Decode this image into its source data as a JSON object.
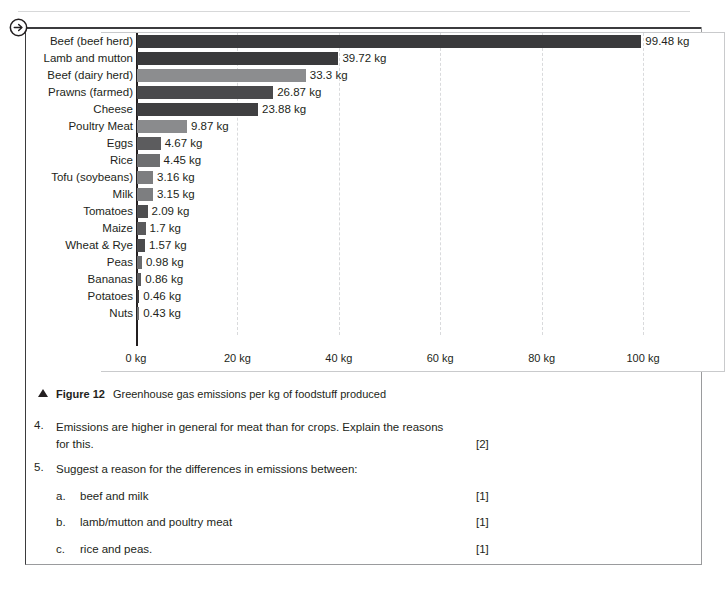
{
  "page": {
    "arrow_icon": "circled-arrow-right-icon"
  },
  "chart_data": {
    "type": "bar",
    "orientation": "horizontal",
    "title": "Greenhouse gas emissions per kg of foodstuff produced",
    "xlabel": "",
    "ylabel": "",
    "unit": "kg",
    "xlim": [
      0,
      100
    ],
    "grid": true,
    "gridlines": [
      20,
      40,
      60,
      80,
      100
    ],
    "legend": "none",
    "tick_labels": [
      "0 kg",
      "20 kg",
      "40 kg",
      "60 kg",
      "80 kg",
      "100 kg"
    ],
    "ticks": [
      0,
      20,
      40,
      60,
      80,
      100
    ],
    "categories": [
      "Beef (beef herd)",
      "Lamb and mutton",
      "Beef (dairy herd)",
      "Prawns (farmed)",
      "Cheese",
      "Poultry Meat",
      "Eggs",
      "Rice",
      "Tofu (soybeans)",
      "Milk",
      "Tomatoes",
      "Maize",
      "Wheat & Rye",
      "Peas",
      "Bananas",
      "Potatoes",
      "Nuts"
    ],
    "values": [
      99.48,
      39.72,
      33.3,
      26.87,
      23.88,
      9.87,
      4.67,
      4.45,
      3.16,
      3.15,
      2.09,
      1.7,
      1.57,
      0.98,
      0.86,
      0.46,
      0.43
    ],
    "value_labels": [
      "99.48 kg",
      "39.72 kg",
      "33.3 kg",
      "26.87 kg",
      "23.88 kg",
      "9.87 kg",
      "4.67 kg",
      "4.45 kg",
      "3.16 kg",
      "3.15 kg",
      "2.09 kg",
      "1.7 kg",
      "1.57 kg",
      "0.98 kg",
      "0.86 kg",
      "0.46 kg",
      "0.43 kg"
    ],
    "bar_colors": [
      "#3a3a3c",
      "#3a3a3c",
      "#8c8d8f",
      "#4a4a4c",
      "#3f3f41",
      "#8a8b8d",
      "#5c5c5e",
      "#6e6f71",
      "#7d7e80",
      "#7d7e80",
      "#4e4e50",
      "#5a5a5c",
      "#4a4a4c",
      "#6a6b6d",
      "#5a5a5c",
      "#3f3f41",
      "#6a6b6d"
    ]
  },
  "caption": {
    "marker": "triangle-up-icon",
    "figure_label": "Figure 12",
    "text": "Greenhouse gas emissions per kg of foodstuff produced"
  },
  "questions": [
    {
      "number": "4.",
      "text": "Emissions are higher in general for meat than for crops. Explain the reasons for this.",
      "marks": "[2]",
      "subquestions": []
    },
    {
      "number": "5.",
      "text": "Suggest a reason for the differences in emissions between:",
      "marks": "",
      "subquestions": [
        {
          "letter": "a.",
          "text": "beef and milk",
          "marks": "[1]"
        },
        {
          "letter": "b.",
          "text": "lamb/mutton and poultry meat",
          "marks": "[1]"
        },
        {
          "letter": "c.",
          "text": "rice and peas.",
          "marks": "[1]"
        }
      ]
    }
  ]
}
